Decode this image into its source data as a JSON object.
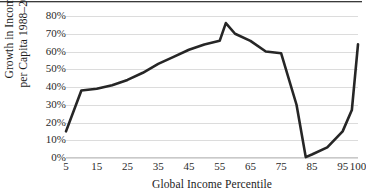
{
  "figure": {
    "top_rule": "horizontal-rule",
    "background_color": "#ffffff",
    "line_color": "#262626",
    "gridline_color": "#dcdcdc"
  },
  "axes": {
    "y_title_line1": "Growth in Income",
    "y_title_line2": "per Capita 1988–2008",
    "x_title": "Global Income Percentile",
    "y_ticks": [
      "0%",
      "10%",
      "20%",
      "30%",
      "40%",
      "50%",
      "60%",
      "70%",
      "80%"
    ],
    "x_ticks": [
      "5",
      "15",
      "25",
      "35",
      "45",
      "55",
      "65",
      "75",
      "85",
      "95",
      "100"
    ]
  },
  "chart_data": {
    "type": "line",
    "title": "",
    "xlabel": "Global Income Percentile",
    "ylabel": "Growth in Income per Capita 1988–2008",
    "xlim": [
      5,
      100
    ],
    "ylim": [
      0,
      80
    ],
    "y_tick_values": [
      0,
      10,
      20,
      30,
      40,
      50,
      60,
      70,
      80
    ],
    "y_tick_labels": [
      "0%",
      "10%",
      "20%",
      "30%",
      "40%",
      "50%",
      "60%",
      "70%",
      "80%"
    ],
    "x_tick_values": [
      5,
      15,
      25,
      35,
      45,
      55,
      65,
      75,
      85,
      95,
      100
    ],
    "x_tick_labels": [
      "5",
      "15",
      "25",
      "35",
      "45",
      "55",
      "65",
      "75",
      "85",
      "95",
      "100"
    ],
    "grid": "horizontal",
    "legend": "none",
    "series": [
      {
        "name": "Growth in Income per Capita 1988-2008",
        "color": "#262626",
        "x": [
          5,
          10,
          15,
          20,
          25,
          30,
          35,
          40,
          45,
          50,
          55,
          57,
          60,
          65,
          70,
          75,
          80,
          83,
          85,
          90,
          95,
          98,
          100
        ],
        "values": [
          15,
          38,
          39,
          41,
          44,
          48,
          53,
          57,
          61,
          64,
          66,
          76,
          70,
          66,
          60,
          59,
          30,
          0.5,
          2,
          6,
          15,
          27,
          64
        ]
      }
    ]
  }
}
